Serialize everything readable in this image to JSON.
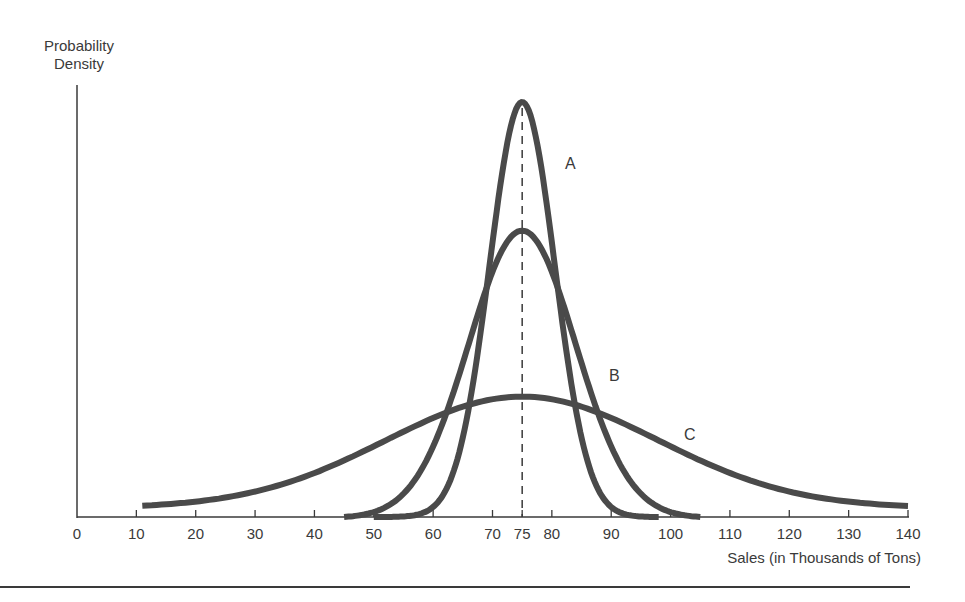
{
  "chart_data": {
    "type": "line",
    "title": "",
    "ylabel_lines": [
      "Probability",
      "Density"
    ],
    "xlabel": "Sales (in Thousands of Tons)",
    "xlim": [
      0,
      140
    ],
    "x_ticks": [
      0,
      10,
      20,
      30,
      40,
      50,
      60,
      70,
      75,
      80,
      90,
      100,
      110,
      120,
      130,
      140
    ],
    "y_ticks": [],
    "grid": false,
    "legend": "inline curve labels",
    "mean_marker": {
      "x": 75,
      "style": "dashed vertical line"
    },
    "series": [
      {
        "name": "A",
        "distribution": "normal",
        "mean": 75,
        "relative_peak": 1.0,
        "x_range": [
          50,
          98
        ],
        "approx_sd": 5.5,
        "label_pos": [
          83,
          "upper right of peak"
        ]
      },
      {
        "name": "B",
        "distribution": "normal",
        "mean": 75,
        "relative_peak": 0.69,
        "x_range": [
          45,
          105
        ],
        "approx_sd": 9,
        "label_pos": [
          91,
          "right side, mid-height"
        ]
      },
      {
        "name": "C",
        "distribution": "normal",
        "mean": 75,
        "relative_peak": 0.29,
        "x_range": [
          11,
          140
        ],
        "approx_sd": 23,
        "label_pos": [
          104,
          "right tail"
        ]
      }
    ],
    "colors": {
      "curves": "#4a4a4a",
      "axes": "#3a3a3a",
      "dashed_mean": "#3a3a3a"
    }
  },
  "labels": {
    "ylabel_line1": "Probability",
    "ylabel_line2": "Density",
    "xlabel": "Sales (in Thousands of Tons)",
    "curve_a": "A",
    "curve_b": "B",
    "curve_c": "C"
  }
}
